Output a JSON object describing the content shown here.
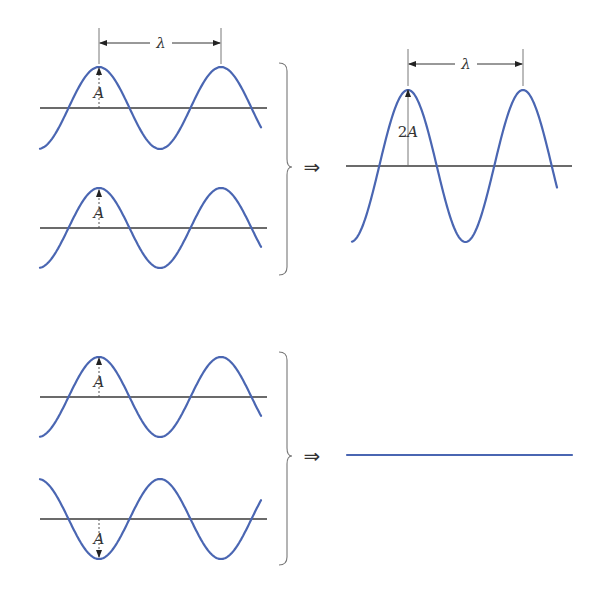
{
  "colors": {
    "wave": "#4a66b2",
    "axis": "#3a3a3a"
  },
  "labels": {
    "wavelength": "λ",
    "amplitude": "A",
    "double_amplitude_num": "2",
    "double_amplitude_var": "A",
    "implies": "⇒"
  },
  "panels": {
    "constructive": {
      "inputs": [
        {
          "axis_y": 108,
          "amp": 41,
          "phase_peak_x": 99,
          "wavelength_px": 122,
          "x_start": 40,
          "x_end": 261,
          "axis_x0": 40,
          "axis_x1": 267,
          "inverted": false,
          "show_wavelength": true
        },
        {
          "axis_y": 228,
          "amp": 40,
          "phase_peak_x": 99,
          "wavelength_px": 122,
          "x_start": 40,
          "x_end": 261,
          "axis_x0": 40,
          "axis_x1": 267,
          "inverted": false,
          "show_wavelength": false
        }
      ],
      "result": {
        "axis_y": 166,
        "amp": 76,
        "phase_peak_x": 408,
        "wavelength_px": 115,
        "x_start": 352,
        "x_end": 557,
        "axis_x0": 346,
        "axis_x1": 572,
        "inverted": false,
        "show_wavelength": true,
        "label": "2A"
      }
    },
    "destructive": {
      "inputs": [
        {
          "axis_y": 397,
          "amp": 40,
          "phase_peak_x": 99,
          "wavelength_px": 122,
          "x_start": 40,
          "x_end": 261,
          "axis_x0": 40,
          "axis_x1": 267,
          "inverted": false
        },
        {
          "axis_y": 519,
          "amp": 40,
          "phase_peak_x": 99,
          "wavelength_px": 122,
          "x_start": 40,
          "x_end": 261,
          "axis_x0": 40,
          "axis_x1": 267,
          "inverted": true
        }
      ],
      "result": {
        "flat_y": 455,
        "x0": 347,
        "x1": 572
      }
    }
  }
}
